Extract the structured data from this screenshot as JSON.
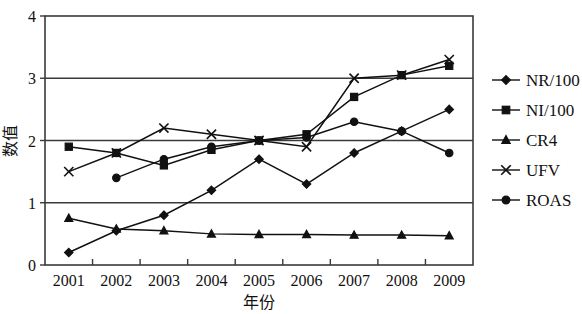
{
  "chart_data": {
    "type": "line",
    "title": "",
    "xlabel": "年份",
    "ylabel": "数值",
    "categories": [
      "2001",
      "2002",
      "2003",
      "2004",
      "2005",
      "2006",
      "2007",
      "2008",
      "2009"
    ],
    "ylim": [
      0,
      4
    ],
    "yticks": [
      "0",
      "1",
      "2",
      "3",
      "4"
    ],
    "ytick_values": [
      0,
      1,
      2,
      3,
      4
    ],
    "grid": "horizontal gridlines at 1, 2, 3 and box frame at 0 and 4",
    "legend_position": "right",
    "series": [
      {
        "name": "NR/100",
        "marker": "diamond",
        "values": [
          0.2,
          0.55,
          0.8,
          1.2,
          1.7,
          1.3,
          1.8,
          2.15,
          2.5
        ]
      },
      {
        "name": "NI/100",
        "marker": "square",
        "values": [
          1.9,
          1.8,
          1.6,
          1.85,
          2.0,
          2.1,
          2.7,
          3.05,
          3.2
        ]
      },
      {
        "name": "CR4",
        "marker": "triangle",
        "values": [
          0.75,
          0.58,
          0.55,
          0.5,
          0.49,
          0.49,
          0.48,
          0.48,
          0.47
        ]
      },
      {
        "name": "UFV",
        "marker": "cross",
        "values": [
          1.5,
          1.8,
          2.2,
          2.1,
          2.0,
          1.9,
          3.0,
          3.05,
          3.3
        ]
      },
      {
        "name": "ROAS",
        "marker": "circle",
        "values": [
          null,
          1.4,
          1.7,
          1.9,
          2.0,
          2.05,
          2.3,
          2.15,
          1.8
        ]
      }
    ]
  },
  "legend": {
    "items": [
      {
        "label": "NR/100",
        "marker": "diamond"
      },
      {
        "label": "NI/100",
        "marker": "square"
      },
      {
        "label": "CR4",
        "marker": "triangle"
      },
      {
        "label": "UFV",
        "marker": "cross"
      },
      {
        "label": "ROAS",
        "marker": "circle"
      }
    ]
  }
}
